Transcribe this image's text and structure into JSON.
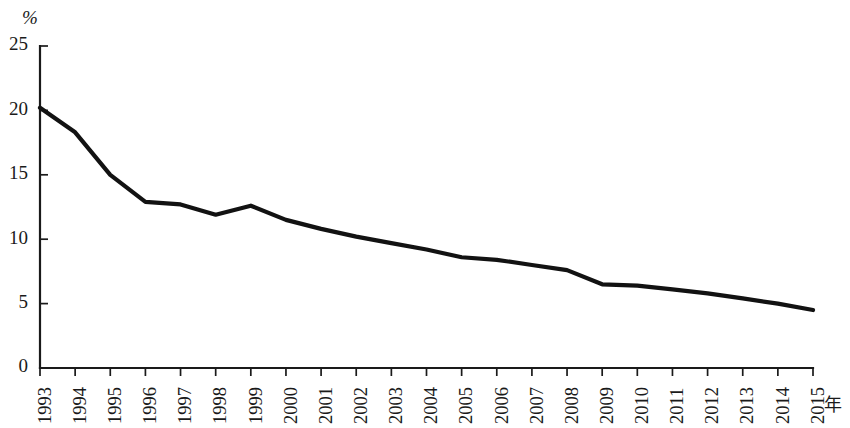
{
  "chart_data": {
    "type": "line",
    "title": "",
    "subtitle": "",
    "xlabel": "年",
    "ylabel": "%",
    "grid": false,
    "legend": null,
    "xlim": [
      1993,
      2015
    ],
    "ylim": [
      0,
      25
    ],
    "y_ticks": [
      0,
      5,
      10,
      15,
      20,
      25
    ],
    "y_tick_labels": [
      "0",
      "5",
      "10",
      "15",
      "20",
      "25"
    ],
    "categories": [
      "1993",
      "1994",
      "1995",
      "1996",
      "1997",
      "1998",
      "1999",
      "2000",
      "2001",
      "2002",
      "2003",
      "2004",
      "2005",
      "2006",
      "2007",
      "2008",
      "2009",
      "2010",
      "2011",
      "2012",
      "2013",
      "2014",
      "2015"
    ],
    "series": [
      {
        "name": "",
        "color": "#121212",
        "values": [
          20.2,
          18.3,
          15.0,
          12.9,
          12.7,
          11.9,
          12.6,
          11.5,
          10.8,
          10.2,
          9.7,
          9.2,
          8.6,
          8.4,
          8.0,
          7.6,
          6.5,
          6.4,
          6.1,
          5.8,
          5.4,
          5.0,
          4.5
        ]
      }
    ],
    "annotations": []
  },
  "axes": {
    "y_unit_label": "%",
    "x_axis_name": "年"
  }
}
